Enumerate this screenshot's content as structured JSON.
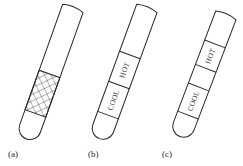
{
  "figure": {
    "panels": [
      {
        "label": "(a)",
        "region": "crosshatched band"
      },
      {
        "label": "(b)",
        "sections": [
          "HOT",
          "COOL"
        ]
      },
      {
        "label": "(c)",
        "sections": [
          "HOT",
          "",
          "COOL"
        ]
      }
    ]
  },
  "colors": {
    "stroke": "#2a2a2a",
    "background": "#ffffff"
  }
}
